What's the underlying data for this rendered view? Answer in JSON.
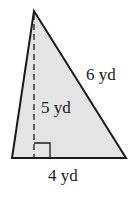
{
  "diagram": {
    "shape": "triangle",
    "fill_color": "#e4e4e4",
    "stroke_color": "#1a1a1a",
    "labels": {
      "side": "6 yd",
      "height": "5 yd",
      "base": "4 yd"
    },
    "right_angle_marker": true,
    "height_line_style": "dashed"
  }
}
